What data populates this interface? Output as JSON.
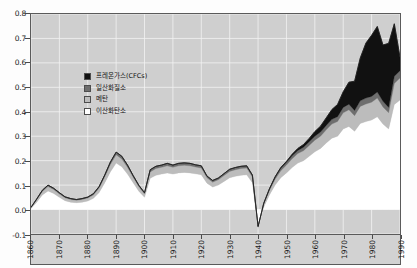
{
  "chart_data": {
    "type": "area",
    "stacked": true,
    "title": "",
    "subtitle": "",
    "xlabel": "",
    "ylabel": "",
    "xlim": [
      1860,
      1990
    ],
    "ylim": [
      -0.1,
      0.8
    ],
    "grid": true,
    "legend_position": "inside-upper-left",
    "background_color": "#cfcfcf",
    "gridline_color": "#f2f2f2",
    "axis_color": "#5a5a5a",
    "x_tick_labels": [
      "1860",
      "1870",
      "1880",
      "1890",
      "1900",
      "1910",
      "1920",
      "1930",
      "1940",
      "1950",
      "1960",
      "1970",
      "1980",
      "1990"
    ],
    "y_tick_labels": [
      "0.8",
      "0.7",
      "0.6",
      "0.5",
      "0.4",
      "0.3",
      "0.2",
      "0.1",
      "0.0",
      "-0.1"
    ],
    "y_tick_values": [
      0.8,
      0.7,
      0.6,
      0.5,
      0.4,
      0.3,
      0.2,
      0.1,
      0.0,
      -0.1
    ],
    "legend": [
      {
        "label": "프레온가스(CFCs)",
        "color": "#111111"
      },
      {
        "label": "일산화질소",
        "color": "#6e6e6e"
      },
      {
        "label": "메탄",
        "color": "#bcbcbc"
      },
      {
        "label": "이산화탄소",
        "color": "#ffffff"
      }
    ],
    "x": [
      1860,
      1862,
      1864,
      1866,
      1868,
      1870,
      1872,
      1874,
      1876,
      1878,
      1880,
      1882,
      1884,
      1886,
      1888,
      1890,
      1892,
      1894,
      1896,
      1898,
      1900,
      1902,
      1904,
      1906,
      1908,
      1910,
      1912,
      1914,
      1916,
      1918,
      1920,
      1922,
      1924,
      1926,
      1928,
      1930,
      1932,
      1934,
      1936,
      1938,
      1940,
      1942,
      1944,
      1946,
      1948,
      1950,
      1952,
      1954,
      1956,
      1958,
      1960,
      1962,
      1964,
      1966,
      1968,
      1970,
      1972,
      1974,
      1976,
      1978,
      1980,
      1982,
      1984,
      1986,
      1988,
      1990
    ],
    "series": [
      {
        "name": "이산화탄소",
        "color": "#ffffff",
        "values": [
          0.004,
          0.03,
          0.06,
          0.076,
          0.066,
          0.05,
          0.036,
          0.03,
          0.028,
          0.03,
          0.035,
          0.046,
          0.07,
          0.11,
          0.155,
          0.19,
          0.175,
          0.145,
          0.11,
          0.075,
          0.05,
          0.128,
          0.14,
          0.145,
          0.15,
          0.145,
          0.15,
          0.152,
          0.15,
          0.146,
          0.142,
          0.108,
          0.092,
          0.1,
          0.115,
          0.13,
          0.136,
          0.14,
          0.142,
          0.11,
          -0.08,
          0.01,
          0.06,
          0.1,
          0.13,
          0.15,
          0.172,
          0.19,
          0.2,
          0.218,
          0.236,
          0.25,
          0.272,
          0.292,
          0.3,
          0.33,
          0.34,
          0.32,
          0.352,
          0.36,
          0.366,
          0.38,
          0.35,
          0.33,
          0.43,
          0.448
        ]
      },
      {
        "name": "메탄",
        "color": "#bcbcbc",
        "values": [
          0.004,
          0.01,
          0.014,
          0.018,
          0.016,
          0.014,
          0.012,
          0.011,
          0.01,
          0.011,
          0.012,
          0.014,
          0.018,
          0.024,
          0.03,
          0.034,
          0.032,
          0.028,
          0.022,
          0.018,
          0.014,
          0.026,
          0.028,
          0.028,
          0.029,
          0.028,
          0.029,
          0.029,
          0.029,
          0.028,
          0.028,
          0.022,
          0.02,
          0.022,
          0.024,
          0.026,
          0.027,
          0.028,
          0.028,
          0.023,
          0.008,
          0.012,
          0.018,
          0.024,
          0.029,
          0.032,
          0.036,
          0.039,
          0.041,
          0.044,
          0.048,
          0.05,
          0.054,
          0.058,
          0.06,
          0.066,
          0.068,
          0.064,
          0.07,
          0.072,
          0.073,
          0.076,
          0.07,
          0.066,
          0.086,
          0.09
        ]
      },
      {
        "name": "일산화질소",
        "color": "#6e6e6e",
        "values": [
          0.001,
          0.003,
          0.005,
          0.006,
          0.005,
          0.005,
          0.004,
          0.004,
          0.003,
          0.004,
          0.004,
          0.005,
          0.006,
          0.008,
          0.01,
          0.011,
          0.011,
          0.009,
          0.007,
          0.006,
          0.005,
          0.009,
          0.009,
          0.009,
          0.01,
          0.009,
          0.01,
          0.01,
          0.01,
          0.009,
          0.009,
          0.007,
          0.007,
          0.007,
          0.008,
          0.009,
          0.009,
          0.009,
          0.009,
          0.008,
          0.003,
          0.004,
          0.006,
          0.008,
          0.01,
          0.011,
          0.012,
          0.013,
          0.014,
          0.015,
          0.016,
          0.017,
          0.018,
          0.019,
          0.02,
          0.022,
          0.023,
          0.021,
          0.023,
          0.024,
          0.024,
          0.025,
          0.023,
          0.022,
          0.029,
          0.03
        ]
      },
      {
        "name": "프레온가스(CFCs)",
        "color": "#111111",
        "values": [
          0.0,
          0.0,
          0.0,
          0.0,
          0.0,
          0.0,
          0.0,
          0.0,
          0.0,
          0.0,
          0.0,
          0.0,
          0.0,
          0.0,
          0.0,
          0.0,
          0.0,
          0.0,
          0.0,
          0.0,
          0.0,
          0.0,
          0.0,
          0.0,
          0.0,
          0.0,
          0.0,
          0.0,
          0.0,
          0.0,
          0.0,
          0.0,
          0.0,
          0.0,
          0.0,
          0.0,
          0.0,
          0.0,
          0.0,
          0.0,
          0.0,
          0.0,
          0.001,
          0.002,
          0.003,
          0.004,
          0.006,
          0.008,
          0.011,
          0.014,
          0.019,
          0.024,
          0.031,
          0.04,
          0.05,
          0.064,
          0.09,
          0.12,
          0.175,
          0.225,
          0.25,
          0.268,
          0.23,
          0.262,
          0.215,
          0.055
        ]
      }
    ]
  }
}
